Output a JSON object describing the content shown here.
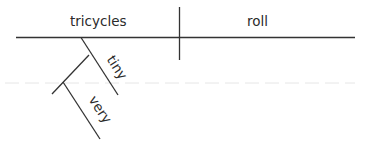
{
  "diagram": {
    "type": "sentence-diagram",
    "subject": "tricycles",
    "predicate": "roll",
    "modifiers": [
      {
        "word": "tiny",
        "modifies": "tricycles"
      },
      {
        "word": "very",
        "modifies": "tiny"
      }
    ],
    "line_color": "#333333",
    "text_color": "#2b2b2b"
  }
}
